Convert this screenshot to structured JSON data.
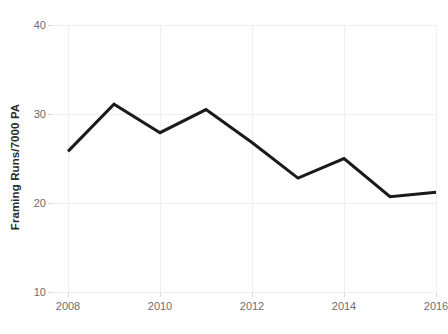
{
  "chart_data": {
    "type": "line",
    "title": "",
    "subtitle": "",
    "xlabel": "",
    "ylabel": "Framing Runs/7000 PA",
    "x": [
      2008,
      2009,
      2010,
      2011,
      2012,
      2013,
      2014,
      2015,
      2016
    ],
    "values": [
      25.8,
      31.1,
      27.9,
      30.5,
      26.8,
      22.8,
      25.0,
      20.7,
      21.2
    ],
    "series": [
      {
        "name": "Framing Runs/7000 PA",
        "values": [
          25.8,
          31.1,
          27.9,
          30.5,
          26.8,
          22.8,
          25.0,
          20.7,
          21.2
        ]
      }
    ],
    "xlim": [
      2008,
      2016
    ],
    "ylim": [
      10,
      40
    ],
    "x_ticks": [
      2008,
      2010,
      2012,
      2014,
      2016
    ],
    "x_tick_labels": [
      "2008",
      "2010",
      "2012",
      "2014",
      "2016"
    ],
    "y_ticks": [
      10,
      20,
      30,
      40
    ],
    "y_tick_labels": [
      "10",
      "20",
      "30",
      "40"
    ],
    "grid": true,
    "grid_color": "#eeeeee",
    "legend": false,
    "legend_position": "none",
    "line_color": "#1a1a1a",
    "line_width": 3,
    "background_color": "#ffffff",
    "tick_label_color": "#6e6e6e",
    "axis_title_color": "#2b2b2b",
    "annotations": []
  }
}
